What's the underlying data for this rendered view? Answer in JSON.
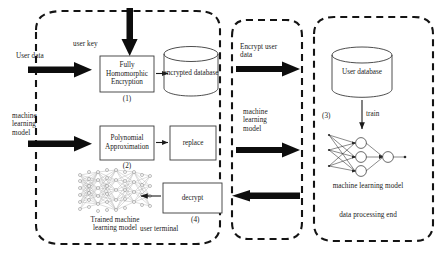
{
  "diagram": {
    "panels": {
      "user_terminal": {
        "name": "user terminal",
        "label": "user terminal"
      },
      "middle_channel": {
        "name": "transmission channel"
      },
      "data_processing_end": {
        "name": "data processing end",
        "label": "data processing end"
      }
    },
    "inputs": {
      "user_data": "User data",
      "machine_learning_model": "machine\nlearning\nmodel",
      "user_key": "user key"
    },
    "boxes": [
      {
        "id": "fhe",
        "label": "Fully\nHomomorphic\nEncryption",
        "step": "(1)"
      },
      {
        "id": "polyapprox",
        "label": "Polynomial\nApproximation",
        "step": "(2)"
      },
      {
        "id": "replace",
        "label": "replace",
        "step": ""
      },
      {
        "id": "decrypt",
        "label": "decrypt",
        "step": "(4)"
      }
    ],
    "cylinders": [
      {
        "id": "encrypted-database",
        "label": "encrypted database"
      },
      {
        "id": "user-database",
        "label": "User database"
      }
    ],
    "networks": [
      {
        "id": "trained-model",
        "label": "Trained machine\nlearning model"
      },
      {
        "id": "ml-model",
        "label": "machine learning model"
      }
    ],
    "channel_labels": {
      "encrypt_user_data": "Encrypt user\ndata",
      "machine_learning_model": "machine\nlearning\nmodel"
    },
    "steps": {
      "train": "train",
      "step3": "(3)"
    },
    "colors": {
      "stroke": "#1a1a1a",
      "thick_arrow": "#0d0d0d",
      "background": "#ffffff",
      "mesh": "#8c8c8c"
    }
  }
}
